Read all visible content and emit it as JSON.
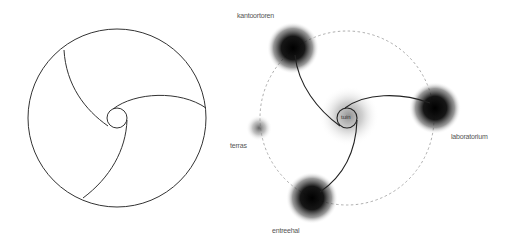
{
  "left_diagram": {
    "description": "Circle divided by three spiral arcs from a small central circle",
    "outer_circle": {
      "cx": 117,
      "cy": 118,
      "r": 89
    },
    "inner_circle": {
      "cx": 117,
      "cy": 118,
      "r": 10
    },
    "stroke_color": "#333333"
  },
  "right_diagram": {
    "dashed_circle": {
      "cx": 347,
      "cy": 118,
      "r": 87,
      "color": "#999999"
    },
    "center": {
      "label": "tuin",
      "cx": 347,
      "cy": 118,
      "r": 10,
      "blob_radius": 30
    },
    "nodes": [
      {
        "id": "kantoortoren",
        "label": "kantoortoren",
        "cx": 293,
        "cy": 48,
        "blob_radius": 26,
        "intensity": "dark"
      },
      {
        "id": "laboratorium",
        "label": "laboratorium",
        "cx": 435,
        "cy": 108,
        "blob_radius": 26,
        "intensity": "dark"
      },
      {
        "id": "entreehal",
        "label": "entreehal",
        "cx": 312,
        "cy": 198,
        "blob_radius": 26,
        "intensity": "dark"
      },
      {
        "id": "terras",
        "label": "terras",
        "cx": 259,
        "cy": 128,
        "blob_radius": 13,
        "intensity": "light"
      }
    ],
    "stroke_color": "#222222"
  }
}
